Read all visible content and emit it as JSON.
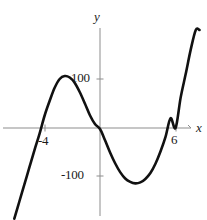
{
  "figure": {
    "kind": "cartesian-graph",
    "background_color": "#ffffff",
    "curve_color": "#111111",
    "axis_color": "#8a8a8a"
  },
  "axes": {
    "x_axis_label": "x",
    "y_axis_label": "y",
    "x_ticks": [
      {
        "label": "-4",
        "value": -4
      },
      {
        "label": "6",
        "value": 6
      }
    ],
    "y_ticks": [
      {
        "label": "100",
        "value": 100
      },
      {
        "label": "-100",
        "value": -100
      }
    ],
    "grid": false,
    "xlim": [
      -6.8,
      7.9
    ],
    "ylim": [
      -190,
      200
    ]
  },
  "chart_data": {
    "type": "line",
    "title": "",
    "xlabel": "x",
    "ylabel": "y",
    "grid": false,
    "legend": null,
    "xlim": [
      -6.8,
      7.9
    ],
    "ylim": [
      -190,
      200
    ],
    "xticks": [
      -4,
      6
    ],
    "xticklabels": [
      "-4",
      "6"
    ],
    "yticks": [
      100,
      -100
    ],
    "yticklabels": [
      "100",
      "-100"
    ],
    "series": [
      {
        "name": "cubic",
        "x": [
          -6.8,
          -6.4,
          -6.0,
          -5.6,
          -5.2,
          -4.8,
          -4.4,
          -4.0,
          -3.6,
          -3.2,
          -2.8,
          -2.4,
          -2.0,
          -1.6,
          -1.2,
          -0.8,
          -0.4,
          0.0,
          0.4,
          0.8,
          1.2,
          1.6,
          2.0,
          2.4,
          2.8,
          3.2,
          3.6,
          4.0,
          4.4,
          4.8,
          5.2,
          5.6,
          6.0,
          6.4,
          6.8,
          7.2,
          7.6,
          7.9
        ],
        "y": [
          -185,
          -150,
          -115,
          -80,
          -45,
          -12,
          25,
          55,
          82,
          100,
          106,
          103,
          92,
          73,
          50,
          26,
          8,
          -2,
          -25,
          -50,
          -72,
          -90,
          -103,
          -110,
          -113,
          -111,
          -104,
          -92,
          -73,
          -48,
          -18,
          20,
          0,
          62,
          110,
          160,
          200,
          200
        ]
      }
    ],
    "features": {
      "local_maximum": {
        "x": -2.9,
        "y": 106
      },
      "local_minimum": {
        "x": 3.0,
        "y": -113
      },
      "x_intercepts": [
        -5.3,
        0.15,
        6.0
      ]
    }
  }
}
